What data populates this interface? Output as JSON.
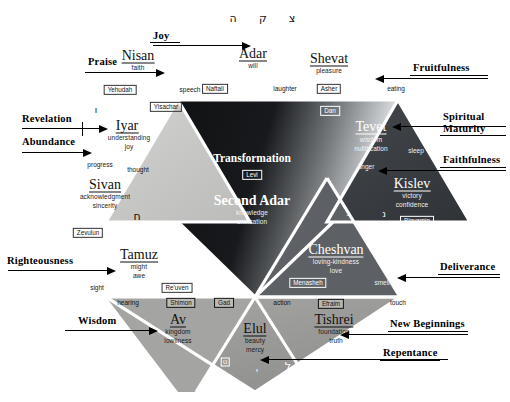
{
  "diagram": {
    "colors": {
      "center_dark": "#15181b",
      "center_light": "#cfd2d4",
      "upper_dark": "#2a2d31",
      "right_dark": "#3c4045",
      "left_light": "#c9c9c7",
      "lower_mid": "#9b9b99",
      "background": "#ffffff",
      "outline": "#ffffff",
      "text_dark": "#111111",
      "text_light": "#ffffff"
    }
  },
  "center": {
    "label_top": "Transformation",
    "tribe": "Levi",
    "label_bottom": "Second Adar",
    "attr1": "knowledge",
    "attr2": "unification"
  },
  "months": [
    {
      "name": "Nisan",
      "attrs": [
        "faith"
      ],
      "tribe": "Yehudah",
      "sense": "speech",
      "tone": "dark"
    },
    {
      "name": "Adar",
      "attrs": [
        "will"
      ],
      "tribe": "Naftali",
      "sense": "laughter",
      "tone": "dark"
    },
    {
      "name": "Shevat",
      "attrs": [
        "pleasure"
      ],
      "tribe": "Asher",
      "sense": "eating",
      "tone": "dark"
    },
    {
      "name": "Tevet",
      "attrs": [
        "wisdom",
        "nullification"
      ],
      "tribe": "Dan",
      "sense": "anger",
      "tone": "light"
    },
    {
      "name": "Kislev",
      "attrs": [
        "victory",
        "confidence"
      ],
      "tribe": "Binyamin",
      "sense": "sleep",
      "tone": "light"
    },
    {
      "name": "Cheshvan",
      "attrs": [
        "loving-kindness",
        "love"
      ],
      "tribe": "Menasheh",
      "sense": "smell",
      "tone": "light"
    },
    {
      "name": "Tishrei",
      "attrs": [
        "foundation",
        "truth"
      ],
      "tribe": "Efraim",
      "sense": "touch",
      "tone": "dark"
    },
    {
      "name": "Elul",
      "attrs": [
        "beauty",
        "mercy"
      ],
      "tribe": "Gad",
      "sense": "action",
      "tone": "dark"
    },
    {
      "name": "Av",
      "attrs": [
        "kingdom",
        "lowliness"
      ],
      "tribe": "Shimon",
      "sense": "hearing",
      "tone": "dark"
    },
    {
      "name": "Tamuz",
      "attrs": [
        "might",
        "awe"
      ],
      "tribe": "Re'uven",
      "sense": "sight",
      "tone": "dark"
    },
    {
      "name": "Sivan",
      "attrs": [
        "acknowledgment",
        "sincerity"
      ],
      "tribe": "Zevulun",
      "sense": "thought",
      "tone": "dark"
    },
    {
      "name": "Iyar",
      "attrs": [
        "understanding",
        "joy"
      ],
      "tribe": "Yisachar",
      "sense": "progress",
      "tone": "dark"
    }
  ],
  "callouts": {
    "joy": "Joy",
    "praise": "Praise",
    "revelation": "Revelation",
    "abundance": "Abundance",
    "righteousness": "Righteousness",
    "wisdom": "Wisdom",
    "fruitfulness": "Fruitfulness",
    "spiritual_maturity_line1": "Spiritual",
    "spiritual_maturity_line2": "Maturity",
    "faithfulness": "Faithfulness",
    "deliverance": "Deliverance",
    "new_beginnings": "New Beginnings",
    "repentance": "Repentance"
  },
  "hebrew_letters": {
    "top_1": "ה",
    "top_2": "ק",
    "top_3": "צ",
    "left_vav": "ו",
    "tamuz_chet": "ח",
    "tevet_ayin": "ע",
    "right_box": "ס",
    "kislev_nun": "נ",
    "cheshvan_nun": "נ",
    "av_tet": "ט",
    "elul_yod": "י",
    "tishrei_lamed": "ל"
  }
}
